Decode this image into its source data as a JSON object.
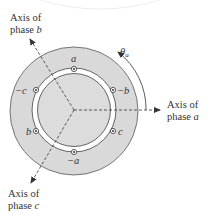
{
  "diagram": {
    "colors": {
      "stator_fill": "#d9d9d9",
      "rotor_fill": "#dcdcdc",
      "gap_fill": "#ffffff",
      "stroke": "#555555",
      "text": "#333333"
    },
    "axes": [
      {
        "id": "a",
        "line1": "Axis of",
        "line2_prefix": "phase ",
        "line2_var": "a"
      },
      {
        "id": "b",
        "line1": "Axis of",
        "line2_prefix": "phase ",
        "line2_var": "b"
      },
      {
        "id": "c",
        "line1": "Axis of",
        "line2_prefix": "phase ",
        "line2_var": "c"
      }
    ],
    "angle_label": {
      "symbol": "θ",
      "subscript": "a"
    },
    "conductors": [
      {
        "label": "a",
        "position": "top"
      },
      {
        "label": "−b",
        "position": "upper-right"
      },
      {
        "label": "c",
        "position": "lower-right"
      },
      {
        "label": "−a",
        "position": "bottom"
      },
      {
        "label": "b",
        "position": "lower-left"
      },
      {
        "label": "−c",
        "position": "upper-left"
      }
    ]
  }
}
